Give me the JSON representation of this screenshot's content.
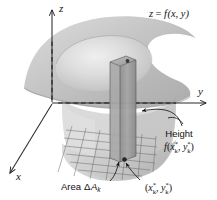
{
  "figure": {
    "kind": "3d-calculus-diagram",
    "topic": "Riemann sum for a double integral: volume under a surface",
    "background_color": "#ffffff",
    "ink_color": "#121212",
    "surface_color": "#b9b9b9",
    "solid_color": "#cfcfcf",
    "prism_color": "#9e9e9e",
    "grid_color": "#6d6d6d"
  },
  "axes": [
    {
      "id": "z",
      "label": "z",
      "direction": "up",
      "arrow": true
    },
    {
      "id": "y",
      "label": "y",
      "direction": "right",
      "arrow": true
    },
    {
      "id": "x",
      "label": "x",
      "direction": "down-left",
      "arrow": true
    }
  ],
  "labels": {
    "surface_equation": {
      "prefix": "z",
      "equals": "=",
      "func": "f",
      "args": "(x, y)",
      "full": "z = f(x, y)"
    },
    "height": {
      "title": "Height",
      "func": "f",
      "open": "(",
      "var1": "x",
      "var1_sup": "*",
      "var1_sub": "k",
      "comma": ", ",
      "var2": "y",
      "var2_sup": "*",
      "var2_sub": "k",
      "close": ")",
      "full": "Height f(x*k, y*k)"
    },
    "area": {
      "title": "Area",
      "delta": "Δ",
      "var": "A",
      "sub": "k",
      "full": "Area ΔAk"
    },
    "sample_point": {
      "open": "(",
      "var1": "x",
      "var1_sup": "*",
      "var1_sub": "k",
      "comma": ", ",
      "var2": "y",
      "var2_sup": "*",
      "var2_sub": "k",
      "close": ")",
      "full": "(x*k, y*k)"
    }
  },
  "elements": {
    "surface_name": "saddle-bowl surface z = f(x, y)",
    "solid_name": "shaded solid region under the surface",
    "prism_name": "vertical rectangular prism (Riemann box)",
    "grid_name": "partition grid on the xy-plane base",
    "sample_dot_top_name": "dot marking f(x*k, y*k) on the surface",
    "sample_dot_base_name": "dot marking sample point (x*k, y*k) in the base rectangle"
  }
}
